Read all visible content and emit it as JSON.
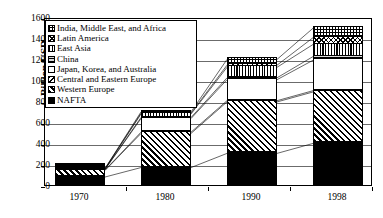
{
  "chart_data": {
    "type": "bar",
    "subtype": "stacked-bar",
    "title": "",
    "xlabel": "",
    "ylabel": "Billion USD",
    "categories": [
      "1970",
      "1980",
      "1990",
      "1998"
    ],
    "ylim": [
      0,
      1600
    ],
    "yticks": [
      0,
      200,
      400,
      600,
      800,
      1000,
      1200,
      1400,
      1600
    ],
    "grid": true,
    "legend_position": "upper-left inside plot",
    "series": [
      {
        "name": "NAFTA",
        "key": "nafta",
        "pattern": "solid-black",
        "values": [
          95,
          185,
          320,
          415
        ]
      },
      {
        "name": "Western Europe",
        "key": "weur",
        "pattern": "diagonal-hatch-up",
        "values": [
          62,
          325,
          490,
          490
        ]
      },
      {
        "name": "Central and Eastern Europe",
        "key": "ceur",
        "pattern": "diagonal-hatch-down",
        "values": [
          4,
          12,
          12,
          12
        ]
      },
      {
        "name": "Japan, Korea, and Australia",
        "key": "japan",
        "pattern": "solid-white",
        "values": [
          6,
          130,
          200,
          290
        ]
      },
      {
        "name": "China",
        "key": "china",
        "pattern": "horizontal-lines-gray",
        "values": [
          2,
          10,
          18,
          35
        ]
      },
      {
        "name": "East Asia",
        "key": "easia",
        "pattern": "vertical-lines",
        "values": [
          3,
          33,
          100,
          115
        ]
      },
      {
        "name": "Latin America",
        "key": "latam",
        "pattern": "cross-diagonal",
        "values": [
          2,
          8,
          20,
          65
        ]
      },
      {
        "name": "India, Middle East, and Africa",
        "key": "india",
        "pattern": "grid-cross",
        "values": [
          3,
          12,
          55,
          90
        ]
      }
    ],
    "totals": [
      177,
      715,
      1215,
      1512
    ],
    "annotations": []
  },
  "legend": {
    "items": [
      {
        "label": "India, Middle East, and Africa",
        "key": "india"
      },
      {
        "label": "Latin America",
        "key": "latam"
      },
      {
        "label": "East Asia",
        "key": "easia"
      },
      {
        "label": "China",
        "key": "china"
      },
      {
        "label": "Japan, Korea, and Australia",
        "key": "japan"
      },
      {
        "label": "Central and Eastern Europe",
        "key": "ceur"
      },
      {
        "label": "Western Europe",
        "key": "weur"
      },
      {
        "label": "NAFTA",
        "key": "nafta"
      }
    ]
  },
  "colors": {
    "ink": "#000000",
    "gridline": "#6b6b6b",
    "background": "#ffffff",
    "china_fill": "#b9b9b9"
  }
}
